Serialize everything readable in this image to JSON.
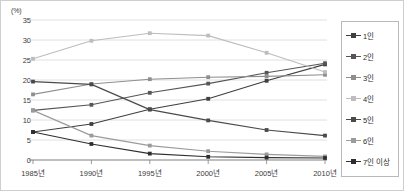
{
  "chart_data": {
    "type": "line",
    "title": "",
    "xlabel": "",
    "ylabel": "(%)",
    "y_unit_label": "(%)",
    "categories": [
      "1985년",
      "1990년",
      "1995년",
      "2000년",
      "2005년",
      "2010년"
    ],
    "ylim": [
      0,
      35
    ],
    "ytick_labels": [
      "0",
      "5",
      "10",
      "15",
      "20",
      "25",
      "30",
      "35"
    ],
    "ytick_values": [
      0,
      5,
      10,
      15,
      20,
      25,
      30,
      35
    ],
    "grid": true,
    "legend_position": "right",
    "series": [
      {
        "name": "1인",
        "color": "#3f3f3f",
        "marker": "square",
        "values": [
          7.0,
          9.0,
          12.7,
          15.3,
          19.8,
          23.9
        ]
      },
      {
        "name": "2인",
        "color": "#565656",
        "marker": "square",
        "values": [
          12.4,
          13.8,
          16.8,
          19.1,
          21.8,
          24.2
        ]
      },
      {
        "name": "3인",
        "color": "#8f8f8f",
        "marker": "square",
        "values": [
          16.4,
          19.0,
          20.2,
          20.7,
          20.9,
          21.3
        ]
      },
      {
        "name": "4인",
        "color": "#bdbdbd",
        "marker": "square",
        "values": [
          25.3,
          29.8,
          31.7,
          31.1,
          26.8,
          22.0
        ]
      },
      {
        "name": "5인",
        "color": "#4a4a4a",
        "marker": "square",
        "values": [
          19.6,
          18.9,
          12.6,
          9.9,
          7.5,
          6.1
        ]
      },
      {
        "name": "6인",
        "color": "#9b9b9b",
        "marker": "square",
        "values": [
          12.4,
          6.1,
          3.6,
          2.2,
          1.4,
          0.9
        ]
      },
      {
        "name": "7인 이상",
        "color": "#2f2f2f",
        "marker": "square",
        "values": [
          7.0,
          4.0,
          1.6,
          0.8,
          0.6,
          0.5
        ]
      }
    ]
  },
  "legend": {
    "items": [
      {
        "label": "1인"
      },
      {
        "label": "2인"
      },
      {
        "label": "3인"
      },
      {
        "label": "4인"
      },
      {
        "label": "5인"
      },
      {
        "label": "6인"
      },
      {
        "label": "7인 이상"
      }
    ]
  },
  "colors": {
    "grid": "#d8d8d8",
    "axis": "#808080",
    "text": "#3a3a3a",
    "legend_border": "#b9b9b9",
    "frame": "#cfcfcf",
    "background": "#ffffff"
  }
}
